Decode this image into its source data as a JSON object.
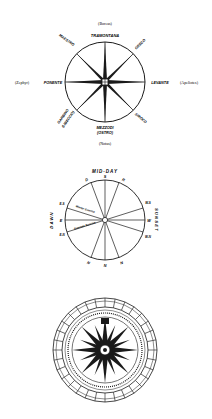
{
  "figures": [
    {
      "id": "wind-rose-italian",
      "greek_names": {
        "north": "(Boreas)",
        "west": "(Zephyr)",
        "east": "(Apeliotes)",
        "south": "(Notus)"
      },
      "winds": {
        "north": "TRAMONTANA",
        "northwest": "MAESTRO",
        "northeast": "GRECO",
        "west": "PONENTE",
        "east": "LEVANTE",
        "southwest_1": "GARBINO",
        "southwest_2": "(LIBECCIO)",
        "southeast": "SIROCO",
        "south_1": "MEZZODI",
        "south_2": "(OSTRO)"
      },
      "colors": {
        "ink": "#1a1a1a",
        "background": "#ffffff"
      }
    },
    {
      "id": "sun-compass",
      "top_label": "MID-DAY",
      "right_label": "SUNSET",
      "left_label": "DAWN",
      "points": {
        "top": "S",
        "bottom": "N",
        "left": "E",
        "right": "W",
        "top_left": "D",
        "top_right": "R",
        "bottom_left": "N",
        "bottom_right": "N",
        "upper_left_tick": "E-S",
        "lower_left_tick": "E-N",
        "upper_right_tick": "W-S",
        "lower_right_tick": "W-N"
      },
      "lines": {
        "winter_sunrise": "Winter Sunrise",
        "summer_sunrise": "Summer Sunrise"
      }
    },
    {
      "id": "ornate-compass-rose",
      "points": 32,
      "rings": 4
    }
  ]
}
